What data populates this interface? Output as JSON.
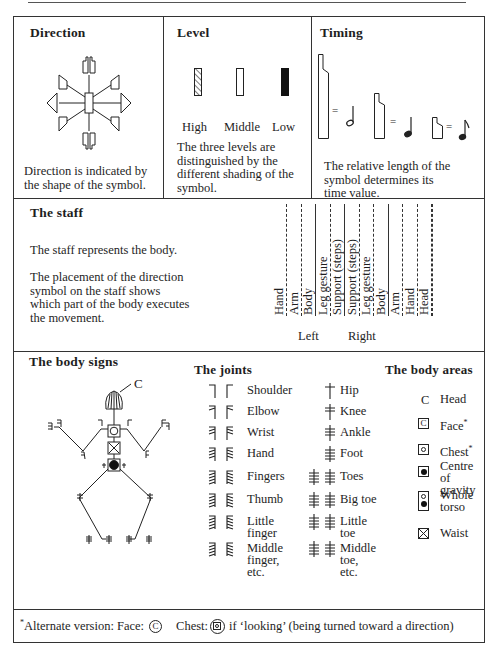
{
  "direction": {
    "title": "Direction",
    "caption_line1": "Direction is indicated by",
    "caption_line2": "the shape of the symbol."
  },
  "level": {
    "title": "Level",
    "items": [
      {
        "label": "High",
        "shading": "hatched"
      },
      {
        "label": "Middle",
        "shading": "dot-center-empty"
      },
      {
        "label": "Low",
        "shading": "solid"
      }
    ],
    "caption_line1": "The three levels are",
    "caption_line2": "distinguished by the",
    "caption_line3": "different shading of the",
    "caption_line4": "symbol."
  },
  "timing": {
    "title": "Timing",
    "equals": "=",
    "notes": [
      "half-note",
      "quarter-note",
      "eighth-note"
    ],
    "caption_line1": "The relative length of the",
    "caption_line2": "symbol determines its",
    "caption_line3": "time value."
  },
  "staff": {
    "title": "The staff",
    "text1": "The staff represents the body.",
    "text2_line1": "The placement of the direction",
    "text2_line2": "symbol on the staff shows",
    "text2_line3": "which part of the body executes",
    "text2_line4": "the movement.",
    "columns": [
      "Hand",
      "Arm",
      "Body",
      "Leg gesture",
      "Support (steps)",
      "Support (steps)",
      "Leg gesture",
      "Body",
      "Arm",
      "Hand",
      "Head"
    ],
    "left_label": "Left",
    "right_label": "Right"
  },
  "body_signs": {
    "title": "The body signs",
    "head_label": "C",
    "joints_title": "The joints",
    "joints_left": [
      {
        "label": "Shoulder"
      },
      {
        "label": "Elbow"
      },
      {
        "label": "Wrist"
      },
      {
        "label": "Hand"
      },
      {
        "label": "Fingers"
      },
      {
        "label": "Thumb"
      },
      {
        "label_line1": "Little",
        "label_line2": "finger"
      },
      {
        "label_line1": "Middle",
        "label_line2": "finger,",
        "label_line3": "etc."
      }
    ],
    "joints_right": [
      {
        "label": "Hip"
      },
      {
        "label": "Knee"
      },
      {
        "label": "Ankle"
      },
      {
        "label": "Foot"
      },
      {
        "label": "Toes"
      },
      {
        "label": "Big toe"
      },
      {
        "label_line1": "Little",
        "label_line2": "toe"
      },
      {
        "label_line1": "Middle",
        "label_line2": "toe,",
        "label_line3": "etc."
      }
    ],
    "areas_title": "The body areas",
    "areas": [
      {
        "label": "Head",
        "symbol": "C"
      },
      {
        "label": "Face",
        "asterisk": "*",
        "symbol": "C"
      },
      {
        "label": "Chest",
        "asterisk": "*"
      },
      {
        "label_line1": "Centre of",
        "label_line2": "gravity"
      },
      {
        "label_line1": "Whole",
        "label_line2": "torso"
      },
      {
        "label": "Waist"
      }
    ]
  },
  "footnote": {
    "asterisk": "*",
    "text1": "Alternate version: Face:",
    "face_symbol": "C",
    "text2": "Chest:",
    "text3": "if ‘looking’ (being turned toward a direction)"
  }
}
